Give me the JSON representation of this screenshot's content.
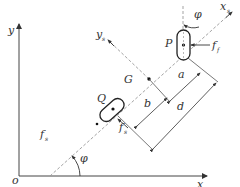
{
  "diagram": {
    "title": "",
    "axes": {
      "origin_label": "o",
      "x_label": "x",
      "y_label": "y"
    },
    "body_frame": {
      "xs_label": "x",
      "xs_sub": "s",
      "ys_label": "y",
      "ys_sub": "s"
    },
    "points": {
      "P": "P",
      "Q": "Q",
      "G": "G"
    },
    "forces": {
      "ff_label": "f",
      "ff_sub": "f",
      "fs_label": "f",
      "fs_sub": "s",
      "fs2_label": "f",
      "fs2_sub": "s"
    },
    "angles": {
      "phi_label": "φ",
      "varphi_label": "φ"
    },
    "dimensions": {
      "a": "a",
      "b": "b",
      "d": "d"
    },
    "colors": {
      "line": "#333333",
      "dashed": "#888888",
      "background": "#ffffff"
    }
  }
}
